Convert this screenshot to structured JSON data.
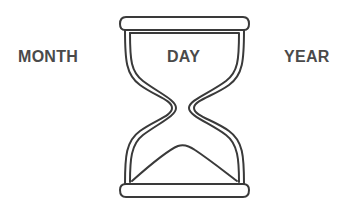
{
  "labels": {
    "left": "MONTH",
    "center": "DAY",
    "right": "YEAR"
  },
  "icon": {
    "name": "hourglass-icon",
    "stroke_color": "#3a3a3a"
  },
  "colors": {
    "text": "#4a4a4a",
    "background": "#ffffff"
  }
}
